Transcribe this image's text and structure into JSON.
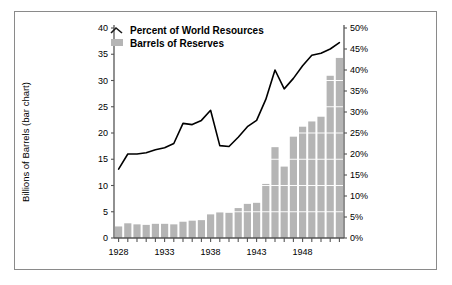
{
  "chart_data": {
    "type": "bar",
    "title": "",
    "xlabel": "",
    "ylabel": "Billions of Barrels (bar chart)",
    "y2label": "",
    "ylim": [
      0,
      40
    ],
    "y2lim": [
      0,
      50
    ],
    "grid": true,
    "legend_position": "top-center",
    "x": [
      1928,
      1929,
      1930,
      1931,
      1932,
      1933,
      1934,
      1935,
      1936,
      1937,
      1938,
      1939,
      1940,
      1941,
      1942,
      1943,
      1944,
      1945,
      1946,
      1947,
      1948,
      1949,
      1950,
      1951,
      1952
    ],
    "categories": [
      "1928",
      "1929",
      "1930",
      "1931",
      "1932",
      "1933",
      "1934",
      "1935",
      "1936",
      "1937",
      "1938",
      "1939",
      "1940",
      "1941",
      "1942",
      "1943",
      "1944",
      "1945",
      "1946",
      "1947",
      "1948",
      "1949",
      "1950",
      "1951",
      "1952"
    ],
    "xticks": [
      "1928",
      "1933",
      "1938",
      "1943",
      "1948"
    ],
    "yticks": [
      "0",
      "5",
      "10",
      "15",
      "20",
      "25",
      "30",
      "35",
      "40"
    ],
    "y2ticks": [
      "0%",
      "5%",
      "10%",
      "15%",
      "20%",
      "25%",
      "30%",
      "35%",
      "40%",
      "45%",
      "50%"
    ],
    "series": [
      {
        "name": "Barrels of Reserves",
        "type": "bar",
        "axis": "left",
        "units": "Billions of Barrels",
        "color": "#b5b5b5",
        "values": [
          2.2,
          2.8,
          2.6,
          2.5,
          2.7,
          2.7,
          2.6,
          3.1,
          3.3,
          3.4,
          4.5,
          4.9,
          4.8,
          5.7,
          6.5,
          6.7,
          10.3,
          17.3,
          13.6,
          19.3,
          21.2,
          22.2,
          23.1,
          30.9,
          34.3
        ]
      },
      {
        "name": "Percent of World Resources",
        "type": "line",
        "axis": "right",
        "units": "%",
        "color": "#000000",
        "values": [
          16.4,
          20.0,
          20.0,
          20.3,
          21.0,
          21.5,
          22.5,
          27.3,
          27.0,
          28.0,
          30.4,
          22.0,
          21.8,
          24.0,
          26.5,
          28.0,
          33.0,
          40.0,
          35.5,
          38.0,
          41.0,
          43.5,
          44.0,
          45.0,
          46.5
        ]
      }
    ]
  },
  "legend": {
    "items": [
      {
        "label": "Percent of World Resources",
        "marker": "line"
      },
      {
        "label": "Barrels of Reserves",
        "marker": "swatch"
      }
    ]
  },
  "axes": {
    "left_title": "Billions of Barrels (bar chart)"
  },
  "colors": {
    "bar": "#b5b5b5",
    "line": "#1a1a1a",
    "grid": "#ffffff",
    "axis": "#555555",
    "border": "#8a8a8a",
    "background": "#ffffff"
  }
}
